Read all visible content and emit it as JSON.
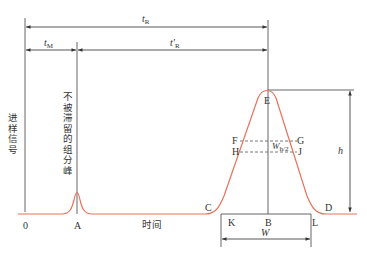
{
  "diagram": {
    "type": "chromatogram",
    "colors": {
      "curve": "#e8735a",
      "lines": "#555555",
      "text": "#333333"
    },
    "labels": {
      "injection_signal": "进样信号",
      "unretained_peak": "不被滞留的组分峰",
      "time_axis": "时间",
      "origin": "0",
      "tR": {
        "main": "t",
        "sub": "R"
      },
      "tM": {
        "main": "t",
        "sub": "M"
      },
      "tR_prime": {
        "main": "t′",
        "sub": "R"
      },
      "height": "h",
      "half_width": {
        "main": "W",
        "sub": "h/2"
      },
      "base_width": "W"
    },
    "points": {
      "A": "A",
      "B": "B",
      "C": "C",
      "D": "D",
      "E": "E",
      "F": "F",
      "G": "G",
      "H": "H",
      "J": "J",
      "K": "K",
      "L": "L"
    }
  }
}
